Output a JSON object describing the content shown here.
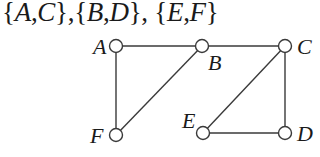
{
  "title": {
    "sets": [
      {
        "a": "A",
        "b": "C"
      },
      {
        "a": "B",
        "b": "D"
      },
      {
        "a": "E",
        "b": "F"
      }
    ],
    "text": "{A,C},{B,D}, {E,F}"
  },
  "graph": {
    "nodes": [
      {
        "id": "A",
        "label": "A",
        "x": 116,
        "y": 46,
        "lx": 93,
        "ly": 54
      },
      {
        "id": "B",
        "label": "B",
        "x": 202,
        "y": 46,
        "lx": 208,
        "ly": 70
      },
      {
        "id": "C",
        "label": "C",
        "x": 285,
        "y": 46,
        "lx": 297,
        "ly": 54
      },
      {
        "id": "F",
        "label": "F",
        "x": 116,
        "y": 135,
        "lx": 90,
        "ly": 143
      },
      {
        "id": "E",
        "label": "E",
        "x": 203,
        "y": 133,
        "lx": 182,
        "ly": 128
      },
      {
        "id": "D",
        "label": "D",
        "x": 285,
        "y": 133,
        "lx": 297,
        "ly": 141
      }
    ],
    "edges": [
      [
        "A",
        "B"
      ],
      [
        "B",
        "C"
      ],
      [
        "A",
        "F"
      ],
      [
        "F",
        "B"
      ],
      [
        "C",
        "E"
      ],
      [
        "C",
        "D"
      ],
      [
        "E",
        "D"
      ]
    ],
    "node_radius": 6.5,
    "stroke_color": "#3a3a3a"
  }
}
